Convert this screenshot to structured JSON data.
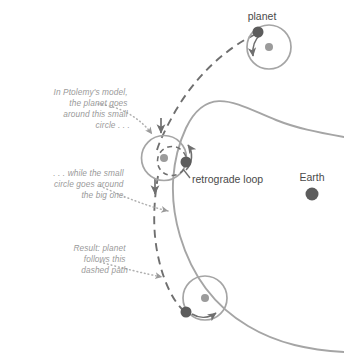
{
  "diagram": {
    "background_color": "#ffffff",
    "colors": {
      "deferent": "#a5a5a5",
      "epicycle": "#a5a5a5",
      "dashed_path": "#6f6f6f",
      "planet_dot": "#5c5c5c",
      "epicycle_center_dot": "#9b9b9b",
      "earth_dot": "#5c5c5c",
      "annotation_text": "#9a9a9a",
      "label_text": "#4a4a4a",
      "leader_line": "#b0b0b0",
      "arrow": "#6f6f6f"
    },
    "labels": {
      "planet": "planet",
      "earth": "Earth",
      "retrograde_loop": "retrograde loop"
    },
    "annotations": [
      {
        "id": "epicycle-note",
        "lines": [
          "In Ptolemy's model,",
          "the planet goes",
          "around this small",
          "circle . . ."
        ],
        "align": "right",
        "x": 130,
        "y": 95
      },
      {
        "id": "deferent-note",
        "lines": [
          ". . . while the small",
          "circle goes around",
          "the big one."
        ],
        "align": "right",
        "x": 126,
        "y": 176
      },
      {
        "id": "dashed-path-note",
        "lines": [
          "Result: planet",
          "follows this",
          "dashed path"
        ],
        "align": "right",
        "x": 128,
        "y": 251
      }
    ],
    "bodies": [
      {
        "id": "earth",
        "name": "Earth",
        "cx": 312,
        "cy": 194,
        "r": 6.5,
        "kind": "earth"
      },
      {
        "id": "planet-top",
        "name": "planet-top",
        "cx": 258,
        "cy": 32,
        "r": 5.5,
        "kind": "planet"
      },
      {
        "id": "planet-middle",
        "name": "planet-middle",
        "cx": 186,
        "cy": 162,
        "r": 5.5,
        "kind": "planet"
      },
      {
        "id": "planet-bottom",
        "name": "planet-bottom",
        "cx": 186,
        "cy": 312,
        "r": 5.5,
        "kind": "planet"
      }
    ],
    "epicycles": [
      {
        "id": "epicycle-top",
        "cx": 269,
        "cy": 47,
        "r": 22,
        "center_dot_r": 4
      },
      {
        "id": "epicycle-middle",
        "cx": 164,
        "cy": 158,
        "r": 22.5,
        "center_dot_r": 4
      },
      {
        "id": "epicycle-bottom",
        "cx": 205,
        "cy": 298,
        "r": 22,
        "center_dot_r": 4
      }
    ],
    "deferent": {
      "id": "deferent-arc",
      "description": "large circular orbit arc around Earth"
    },
    "dashed_path": {
      "id": "planet-dashed-path",
      "description": "path actually traced by the planet including the retrograde loop"
    },
    "motion_arrows": [
      {
        "id": "arrow-epicycle-top",
        "description": "planet motion on top epicycle"
      },
      {
        "id": "arrow-epicycle-middle",
        "description": "planet motion on middle epicycle"
      },
      {
        "id": "arrow-epicycle-bottom",
        "description": "planet motion on bottom epicycle"
      },
      {
        "id": "arrow-path-upper",
        "description": "direction along dashed path, upper"
      },
      {
        "id": "arrow-path-lower",
        "description": "direction along dashed path, lower"
      }
    ]
  }
}
